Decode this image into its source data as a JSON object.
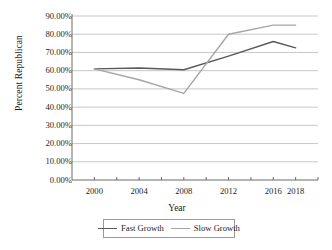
{
  "chart_data": {
    "type": "line",
    "title": "",
    "xlabel": "Year",
    "ylabel": "Percent Republican",
    "x": [
      2000,
      2004,
      2008,
      2012,
      2016,
      2018
    ],
    "categories": [
      "2000",
      "2004",
      "2008",
      "2012",
      "2016",
      "2018"
    ],
    "xtick_labels": [
      "2000",
      "2004",
      "2008",
      "2012",
      "2016",
      "2018"
    ],
    "ytick_labels": [
      "0.00%",
      "10.00%",
      "20.00%",
      "30.00%",
      "40.00%",
      "50.00%",
      "60.00%",
      "70.00%",
      "80.00%",
      "90.00%"
    ],
    "ytick_values": [
      0,
      10,
      20,
      30,
      40,
      50,
      60,
      70,
      80,
      90
    ],
    "ylim": [
      0,
      90
    ],
    "xlim": [
      1998,
      2020
    ],
    "grid": "horizontal",
    "legend_position": "bottom",
    "series": [
      {
        "name": "Fast Growth",
        "color": "#595959",
        "values": [
          61.0,
          61.5,
          60.5,
          68.0,
          76.0,
          72.5
        ]
      },
      {
        "name": "Slow Growth",
        "color": "#a6a6a6",
        "values": [
          61.0,
          55.0,
          47.5,
          80.0,
          85.0,
          85.0
        ]
      }
    ]
  },
  "axes": {
    "y_axis_title": "Percent Republican",
    "x_axis_title": "Year"
  },
  "legend": {
    "items": [
      {
        "label": "Fast Growth",
        "color": "#595959"
      },
      {
        "label": "Slow Growth",
        "color": "#a6a6a6"
      }
    ]
  },
  "colors": {
    "gridline": "#b0b0b0",
    "axis": "#595959",
    "text": "#1d1d1d",
    "fast_growth": "#595959",
    "slow_growth": "#a6a6a6"
  }
}
